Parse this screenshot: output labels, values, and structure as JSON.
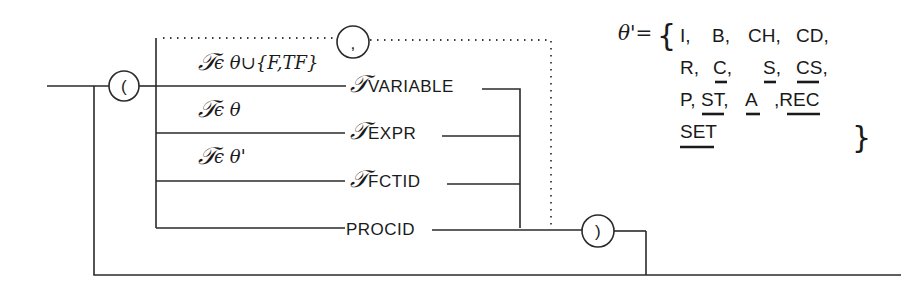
{
  "diagram": {
    "type": "syntax-diagram",
    "open_paren": "(",
    "close_paren": ")",
    "separator": ",",
    "tau": "𝒯",
    "alternatives": [
      {
        "condition": "ϵ θ∪{F,TF}",
        "label": "VARIABLE"
      },
      {
        "condition": "ϵ θ",
        "label": "EXPR"
      },
      {
        "condition": "ϵ θ'",
        "label": "FCTID"
      },
      {
        "condition": "",
        "label": "PROCID"
      }
    ]
  },
  "theta_prime_set": {
    "lhs": "θ'=",
    "open_brace": "{",
    "close_brace": "}",
    "rows": [
      [
        "I,",
        "B,",
        "CH,",
        "CD,"
      ],
      [
        "R,",
        "C,",
        "S,",
        "CS,"
      ],
      [
        "P,",
        "ST,",
        "A",
        ",REC"
      ],
      [
        "SET"
      ]
    ],
    "underlined": [
      "C",
      "S",
      "CS",
      "ST",
      "A",
      "REC",
      "SET"
    ]
  }
}
